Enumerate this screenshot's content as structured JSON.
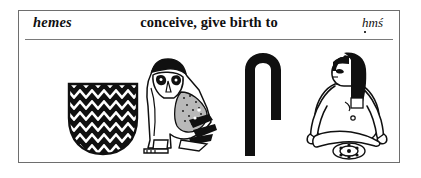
{
  "entry": {
    "headword": "hemes",
    "gloss": "conceive, give birth to",
    "transliteration": "ḥmś",
    "transliteration_parts": {
      "h_underdot": "ḥ",
      "m": "m",
      "s_acute": "ś"
    }
  },
  "glyphs": [
    {
      "name": "animal-belly-sign",
      "gardiner": "F32",
      "value": "ḥ"
    },
    {
      "name": "owl-sign",
      "gardiner": "G17",
      "value": "m"
    },
    {
      "name": "folded-cloth-sign",
      "gardiner": "S29",
      "value": "ś"
    },
    {
      "name": "woman-giving-birth-sign",
      "gardiner": "B3",
      "value": "determinative"
    }
  ],
  "colors": {
    "ink": "#101010",
    "frame": "#6e6e6e",
    "rule": "#7a7a7a",
    "paper": "#ffffff"
  }
}
